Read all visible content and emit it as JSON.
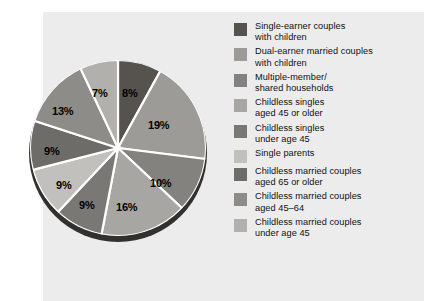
{
  "panel": {
    "background": "#ececed"
  },
  "chart_data": {
    "type": "pie",
    "title": "",
    "subtitle": "",
    "xlabel": "",
    "ylabel": "",
    "legend_position": "right",
    "grid": false,
    "unit": "%",
    "categories": [
      "Single-earner couples with children",
      "Dual-earner married couples with children",
      "Multiple-member/ shared households",
      "Childless singles aged 45 or older",
      "Childless singles under age 45",
      "Single parents",
      "Childless married couples aged 65 or older",
      "Childless married couples aged 45-64",
      "Childless married couples under age 45"
    ],
    "values": [
      8,
      19,
      10,
      16,
      9,
      9,
      9,
      13,
      7
    ],
    "labels": [
      "8%",
      "19%",
      "10%",
      "16%",
      "9%",
      "9%",
      "9%",
      "13%",
      "7%"
    ],
    "colors": [
      "#56534f",
      "#9d9b97",
      "#84827e",
      "#a8a6a2",
      "#7a7874",
      "#c2c0bc",
      "#6e6c68",
      "#8e8c88",
      "#b2b0ac"
    ],
    "slice_separator_color": "#ffffff",
    "rim_color": "#33312f"
  },
  "pie": {
    "labels": [
      {
        "text": "8%",
        "x": 122,
        "y": 88
      },
      {
        "text": "19%",
        "x": 148,
        "y": 120
      },
      {
        "text": "10%",
        "x": 150,
        "y": 178
      },
      {
        "text": "16%",
        "x": 116,
        "y": 202
      },
      {
        "text": "9%",
        "x": 79,
        "y": 200
      },
      {
        "text": "9%",
        "x": 56,
        "y": 180
      },
      {
        "text": "9%",
        "x": 44,
        "y": 146
      },
      {
        "text": "13%",
        "x": 52,
        "y": 106
      },
      {
        "text": "7%",
        "x": 92,
        "y": 88
      }
    ]
  },
  "legend": {
    "items": [
      {
        "label": "Single-earner couples\nwith children",
        "color": "#56534f",
        "swatch_name": "legend-swatch-single-earner-couples"
      },
      {
        "label": "Dual-earner married couples\nwith children",
        "color": "#9d9b97",
        "swatch_name": "legend-swatch-dual-earner-couples"
      },
      {
        "label": "Multiple-member/\nshared households",
        "color": "#84827e",
        "swatch_name": "legend-swatch-multiple-member"
      },
      {
        "label": "Childless singles\naged 45 or older",
        "color": "#a8a6a2",
        "swatch_name": "legend-swatch-childless-singles-45-older"
      },
      {
        "label": "Childless singles\nunder age 45",
        "color": "#7a7874",
        "swatch_name": "legend-swatch-childless-singles-under-45"
      },
      {
        "label": "Single parents",
        "color": "#c2c0bc",
        "swatch_name": "legend-swatch-single-parents"
      },
      {
        "label": "Childless married couples\naged 65 or older",
        "color": "#6e6c68",
        "swatch_name": "legend-swatch-childless-married-65-older"
      },
      {
        "label": "Childless married couples\naged 45–64",
        "color": "#8e8c88",
        "swatch_name": "legend-swatch-childless-married-45-64"
      },
      {
        "label": "Childless married couples\nunder age 45",
        "color": "#b2b0ac",
        "swatch_name": "legend-swatch-childless-married-under-45"
      }
    ]
  }
}
